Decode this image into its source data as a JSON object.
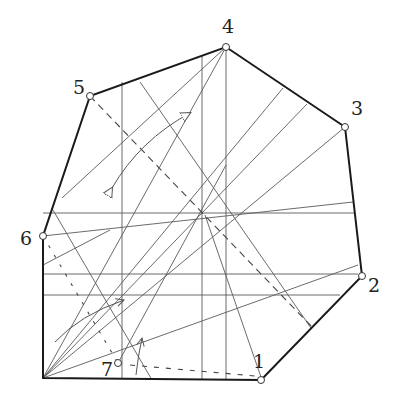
{
  "diagram": {
    "type": "origami-crease-pattern",
    "colors": {
      "edge": "#1a1a1a",
      "crease": "#555555",
      "dashed": "#444444",
      "vertex_fill": "#ffffff"
    },
    "vertices": [
      {
        "label": "1",
        "x": 261,
        "y": 380,
        "lx": 253,
        "ly": 362
      },
      {
        "label": "2",
        "x": 362,
        "y": 276,
        "lx": 369,
        "ly": 292
      },
      {
        "label": "3",
        "x": 345,
        "y": 127,
        "lx": 351,
        "ly": 113
      },
      {
        "label": "4",
        "x": 226,
        "y": 47,
        "lx": 222,
        "ly": 33
      },
      {
        "label": "5",
        "x": 90,
        "y": 96,
        "lx": 72,
        "ly": 93
      },
      {
        "label": "6",
        "x": 43,
        "y": 236,
        "lx": 20,
        "ly": 245
      },
      {
        "label": "7",
        "x": 118,
        "y": 363,
        "lx": 100,
        "ly": 375
      }
    ],
    "corner": {
      "x": 43,
      "y": 378
    }
  }
}
